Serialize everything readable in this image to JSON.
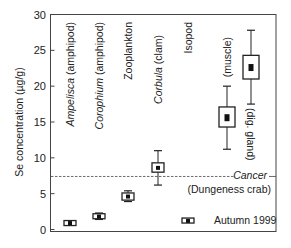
{
  "chart_data": {
    "type": "box",
    "title": "",
    "xlabel": "",
    "ylabel": "Se concentration (µg/g)",
    "ylim": [
      0,
      30
    ],
    "yticks": [
      0,
      5,
      10,
      15,
      20,
      25,
      30
    ],
    "grid": false,
    "categories": [
      "Ampelisca (amphipod)",
      "Corophium (amphipod)",
      "Zooplankton",
      "Corbula (clam)",
      "Isopod",
      "Cancer (muscle)",
      "Cancer (dig. gland)"
    ],
    "series": [
      {
        "name": "Autumn 1999",
        "points": [
          {
            "label": "Ampelisca (amphipod)",
            "italic_part": "Ampelisca",
            "rest": " (amphipod)",
            "x_px": 70,
            "median": 0.9,
            "box_low": 0.6,
            "box_high": 1.2,
            "whisker_low": 0.6,
            "whisker_high": 1.2,
            "box_half_width": 6
          },
          {
            "label": "Corophium (amphipod)",
            "italic_part": "Corophium",
            "rest": " (amphipod)",
            "x_px": 99,
            "median": 1.8,
            "box_low": 1.5,
            "box_high": 2.2,
            "whisker_low": 1.4,
            "whisker_high": 2.3,
            "box_half_width": 6
          },
          {
            "label": "Zooplankton",
            "italic_part": "",
            "rest": "Zooplankton",
            "x_px": 128,
            "median": 4.6,
            "box_low": 4.1,
            "box_high": 5.1,
            "whisker_low": 3.9,
            "whisker_high": 5.4,
            "box_half_width": 6
          },
          {
            "label": "Corbula (clam)",
            "italic_part": "Corbula",
            "rest": " (clam)",
            "x_px": 158,
            "median": 8.6,
            "box_low": 8.0,
            "box_high": 9.3,
            "whisker_low": 6.2,
            "whisker_high": 11.0,
            "box_half_width": 6
          },
          {
            "label": "Isopod",
            "italic_part": "",
            "rest": "Isopod",
            "x_px": 188,
            "median": 1.2,
            "box_low": 1.0,
            "box_high": 1.5,
            "whisker_low": 1.0,
            "whisker_high": 1.5,
            "box_half_width": 6
          },
          {
            "label": "(muscle)",
            "italic_part": "",
            "rest": "(muscle)",
            "x_px": 227,
            "median": 15.6,
            "box_low": 14.3,
            "box_high": 17.1,
            "whisker_low": 11.2,
            "whisker_high": 20.0,
            "box_half_width": 8
          },
          {
            "label": "(dig. gland)",
            "italic_part": "",
            "rest": "(dig. gland)",
            "x_px": 251,
            "median": 22.6,
            "box_low": 21.0,
            "box_high": 24.3,
            "whisker_low": 17.5,
            "whisker_high": 27.8,
            "box_half_width": 8
          }
        ]
      }
    ],
    "reference_line": {
      "value": 7.4,
      "style": "dashed",
      "label_italic": "Cancer",
      "label_sub": "(Dungeness crab)"
    },
    "legend": {
      "text": "Autumn 1999",
      "position": "lower right"
    }
  }
}
